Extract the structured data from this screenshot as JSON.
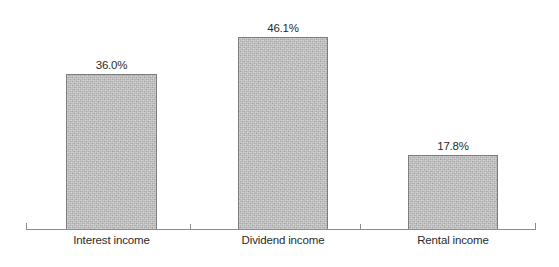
{
  "chart_data": {
    "type": "bar",
    "title": "",
    "subtitle": "",
    "xlabel": "",
    "ylabel": "",
    "categories": [
      "Interest income",
      "Dividend income",
      "Rental income"
    ],
    "values": [
      36.0,
      46.1,
      17.8
    ],
    "value_labels": [
      "36.0%",
      "46.1%",
      "17.8%"
    ],
    "ylim": [
      0,
      46.1
    ],
    "grid": false,
    "legend": null,
    "y_axis_visible": false,
    "x_axis_visible": true,
    "annotations": []
  },
  "style": {
    "background": "#ffffff",
    "bar_fill": "#b9b9b9",
    "bar_border": "#7d7d7d",
    "axis_color": "#8d8d8d",
    "text_color": "#2b2b2b"
  },
  "bars": [
    {
      "name": "interest-income",
      "category": "Interest income",
      "value_label": "36.0%",
      "left": 66,
      "width": 91,
      "height": 156,
      "label_left": 66,
      "label_width": 91
    },
    {
      "name": "dividend-income",
      "category": "Dividend income",
      "value_label": "46.1%",
      "left": 238,
      "width": 90,
      "height": 193,
      "label_left": 233,
      "label_width": 100
    },
    {
      "name": "rental-income",
      "category": "Rental income",
      "value_label": "17.8%",
      "left": 408,
      "width": 90,
      "height": 75,
      "label_left": 403,
      "label_width": 100
    }
  ]
}
